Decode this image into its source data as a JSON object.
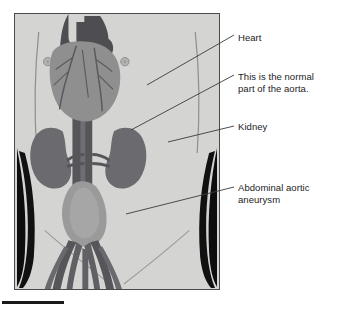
{
  "figure": {
    "type": "medical-illustration",
    "background_color": "#d4d4d2",
    "frame_border_color": "#4a4a4a",
    "leader_line_color": "#3a3a3a",
    "text_color": "#1c1c1c"
  },
  "labels": {
    "heart": "Heart",
    "normal_aorta": "This is the normal\npart of the aorta.",
    "kidney": "Kidney",
    "aneurysm": "Abdominal aortic\naneurysm"
  },
  "anatomy": {
    "heart": {
      "name": "heart",
      "body_color": "#8f8f8f",
      "great_vessel_color": "#4e4e52",
      "coronary_color": "#5a5a5e"
    },
    "aorta": {
      "name": "aorta",
      "color": "#55555a",
      "highlight_color": "#6e6e73"
    },
    "kidney_left": {
      "name": "left-kidney",
      "color": "#6b6b6f"
    },
    "kidney_right": {
      "name": "right-kidney",
      "color": "#6b6b6f"
    },
    "aneurysm": {
      "name": "abdominal-aortic-aneurysm",
      "color": "#9a9a9a"
    },
    "iliac_vessels": {
      "name": "iliac-arteries",
      "color": "#55555a"
    },
    "torso_shadow": {
      "name": "flank-shadow",
      "color": "#0d0d0d"
    },
    "nipple_marker": {
      "name": "nipple-marker",
      "color": "#a9a9a7"
    }
  }
}
